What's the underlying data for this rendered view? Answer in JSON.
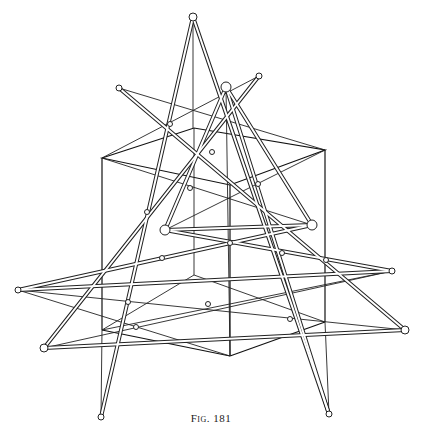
{
  "figure": {
    "caption": "Fig. 181"
  },
  "geometry": {
    "cube": {
      "top": [
        [
          102,
          158
        ],
        [
          194,
          128
        ],
        [
          325,
          150
        ],
        [
          230,
          185
        ]
      ],
      "bottom": [
        [
          102,
          330
        ],
        [
          194,
          275
        ],
        [
          325,
          322
        ],
        [
          230,
          356
        ]
      ]
    },
    "apex_top": [
      193,
      17
    ],
    "apex_inner": [
      226,
      87
    ],
    "upper_nodes": [
      [
        119,
        88
      ],
      [
        259,
        76
      ]
    ],
    "triangle": [
      [
        226,
        87
      ],
      [
        165,
        230
      ],
      [
        312,
        225
      ]
    ],
    "star_nodes": [
      [
        18,
        290
      ],
      [
        44,
        348
      ],
      [
        392,
        271
      ],
      [
        405,
        330
      ]
    ],
    "bottom_nodes": [
      [
        101,
        417
      ],
      [
        329,
        414
      ]
    ]
  }
}
